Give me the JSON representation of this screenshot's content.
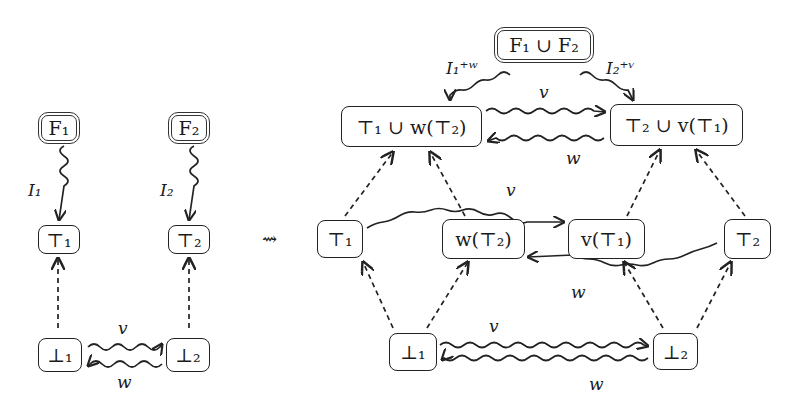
{
  "left_diagram": {
    "nodes": {
      "F1": "F₁",
      "F2": "F₂",
      "T1": "⊤₁",
      "T2": "⊤₂",
      "B1": "⊥₁",
      "B2": "⊥₂"
    },
    "edges": {
      "I1": "I₁",
      "I2": "I₂",
      "v": "v",
      "w": "w"
    }
  },
  "transform_arrow": "⇝",
  "right_diagram": {
    "nodes": {
      "F12": "F₁ ∪ F₂",
      "T1wT2": "⊤₁ ∪ w(⊤₂)",
      "T2vT1": "⊤₂ ∪ v(⊤₁)",
      "T1": "⊤₁",
      "wT2": "w(⊤₂)",
      "vT1": "v(⊤₁)",
      "T2": "⊤₂",
      "B1": "⊥₁",
      "B2": "⊥₂"
    },
    "edges": {
      "I1w": "I₁⁺ʷ",
      "I2v": "I₂⁺ᵛ",
      "top_v": "v",
      "top_w": "w",
      "mid_v": "v",
      "mid_w": "w",
      "bot_v": "v",
      "bot_w": "w"
    }
  }
}
